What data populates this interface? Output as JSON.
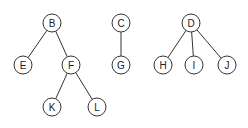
{
  "diagram": {
    "type": "forest",
    "node_radius": 9,
    "colors": {
      "stroke": "#333333",
      "fill": "#ffffff",
      "text": "#222222",
      "background": "#ffffff"
    },
    "trees": [
      {
        "root": "B",
        "nodes": [
          {
            "id": "B",
            "label": "B",
            "x": 52,
            "y": 23
          },
          {
            "id": "E",
            "label": "E",
            "x": 23,
            "y": 65
          },
          {
            "id": "F",
            "label": "F",
            "x": 71,
            "y": 65
          },
          {
            "id": "K",
            "label": "K",
            "x": 52,
            "y": 107
          },
          {
            "id": "L",
            "label": "L",
            "x": 97,
            "y": 107
          }
        ],
        "edges": [
          [
            "B",
            "E"
          ],
          [
            "B",
            "F"
          ],
          [
            "F",
            "K"
          ],
          [
            "F",
            "L"
          ]
        ]
      },
      {
        "root": "C",
        "nodes": [
          {
            "id": "C",
            "label": "C",
            "x": 121,
            "y": 23
          },
          {
            "id": "G",
            "label": "G",
            "x": 121,
            "y": 65
          }
        ],
        "edges": [
          [
            "C",
            "G"
          ]
        ]
      },
      {
        "root": "D",
        "nodes": [
          {
            "id": "D",
            "label": "D",
            "x": 191,
            "y": 23
          },
          {
            "id": "H",
            "label": "H",
            "x": 163,
            "y": 65
          },
          {
            "id": "I",
            "label": "I",
            "x": 194,
            "y": 65
          },
          {
            "id": "J",
            "label": "J",
            "x": 227,
            "y": 65
          }
        ],
        "edges": [
          [
            "D",
            "H"
          ],
          [
            "D",
            "I"
          ],
          [
            "D",
            "J"
          ]
        ]
      }
    ]
  }
}
